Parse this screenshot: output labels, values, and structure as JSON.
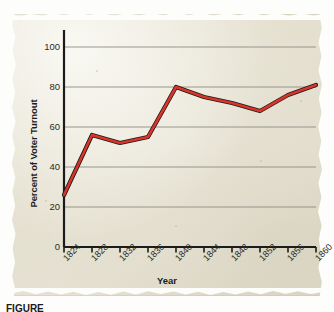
{
  "figure": {
    "media": "aged-paper-scan",
    "caption_partial": "FIGURE",
    "paper_color": "#e8e4d6"
  },
  "chart_data": {
    "type": "line",
    "title": "",
    "subtitle": "",
    "xlabel": "Year",
    "ylabel": "Percent of Voter Turnout",
    "x": [
      1824,
      1828,
      1832,
      1836,
      1840,
      1844,
      1848,
      1852,
      1856,
      1860
    ],
    "categories": [
      "1824",
      "1828",
      "1832",
      "1836",
      "1840",
      "1844",
      "1848",
      "1852",
      "1856",
      "1860"
    ],
    "values": [
      26,
      56,
      52,
      55,
      80,
      75,
      72,
      68,
      76,
      81
    ],
    "series": [
      {
        "name": "Percent of Voter Turnout",
        "color": "#d8342a",
        "shadow_color": "#1a1a1a",
        "values": [
          26,
          56,
          52,
          55,
          80,
          75,
          72,
          68,
          76,
          81
        ]
      }
    ],
    "xlim": [
      1824,
      1860
    ],
    "ylim": [
      0,
      100
    ],
    "ytick_labels": [
      "0",
      "20",
      "40",
      "60",
      "80",
      "100"
    ],
    "ytick_values": [
      0,
      20,
      40,
      60,
      80,
      100
    ],
    "xtick_labels": [
      "1824",
      "1828",
      "1832",
      "1836",
      "1840",
      "1844",
      "1848",
      "1852",
      "1856",
      "1860"
    ],
    "grid": "horizontal",
    "grid_color": "#8d8d86",
    "axis_color": "#1b1b1b",
    "legend": "none",
    "legend_position": "none",
    "xtick_rotation": -45
  }
}
